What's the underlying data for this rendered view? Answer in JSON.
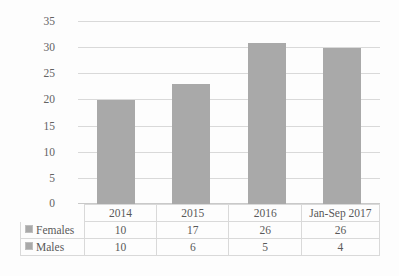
{
  "chart_data": {
    "type": "bar",
    "title": "",
    "subtitle": "",
    "xlabel": "",
    "ylabel": "",
    "categories": [
      "2014",
      "2015",
      "2016",
      "Jan-Sep 2017"
    ],
    "values": [
      20,
      23,
      31,
      30
    ],
    "ylim": [
      0,
      35
    ],
    "ytick_labels": [
      "0",
      "5",
      "10",
      "15",
      "20",
      "25",
      "30",
      "35"
    ],
    "ytick_values": [
      0,
      5,
      10,
      15,
      20,
      25,
      30,
      35
    ],
    "grid": true,
    "legend_position": "data-table-left",
    "bar_color": "#a9a9a9",
    "gridline_color": "#d9d9d9",
    "series": [
      {
        "name": "Females",
        "values": [
          10,
          17,
          26,
          26
        ]
      },
      {
        "name": "Males",
        "values": [
          10,
          6,
          5,
          4
        ]
      }
    ],
    "data_table": {
      "header": [
        "",
        "2014",
        "2015",
        "2016",
        "Jan-Sep 2017"
      ],
      "rows": [
        {
          "label": "Females",
          "marker": "legend-swatch-icon",
          "values": [
            "10",
            "17",
            "26",
            "26"
          ]
        },
        {
          "label": "Males",
          "marker": "legend-swatch-icon",
          "values": [
            "10",
            "6",
            "5",
            "4"
          ]
        }
      ]
    }
  }
}
